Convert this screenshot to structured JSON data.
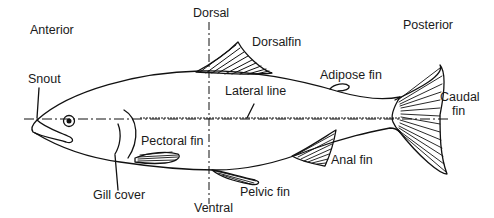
{
  "diagram": {
    "colors": {
      "line": "#111111",
      "background": "#ffffff",
      "text": "#1a1a1a"
    },
    "orientation_labels": {
      "anterior": "Anterior",
      "posterior": "Posterior",
      "dorsal": "Dorsal",
      "ventral": "Ventral"
    },
    "part_labels": {
      "snout": "Snout",
      "dorsal_fin": "Dorsalfin",
      "adipose_fin": "Adipose fin",
      "lateral_line": "Lateral line",
      "caudal_fin_line1": "Caudal",
      "caudal_fin_line2": "fin",
      "pectoral_fin": "Pectoral fin",
      "anal_fin": "Anal fin",
      "gill_cover": "Gill cover",
      "pelvic_fin": "Pelvic fin"
    },
    "axes": [
      {
        "name": "anterior-posterior axis",
        "style": "dash-dot"
      },
      {
        "name": "dorsal-ventral axis",
        "style": "dash-dot"
      }
    ]
  }
}
